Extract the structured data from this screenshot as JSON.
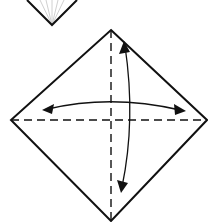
{
  "diagram": {
    "type": "origami-folding-step",
    "colors": {
      "outline": "#111111",
      "crease_fan": "#bbbbbb",
      "background": "#ffffff"
    },
    "previous_step": {
      "shape": "partial-diamond-tip",
      "description": "bottom tip of previous step with radiating crease lines"
    },
    "current_step": {
      "shape": "square-on-point",
      "valley_folds": [
        "vertical-diagonal",
        "horizontal-diagonal"
      ],
      "arrows": [
        "fold-and-unfold-left-right",
        "fold-and-unfold-top-bottom"
      ]
    }
  }
}
